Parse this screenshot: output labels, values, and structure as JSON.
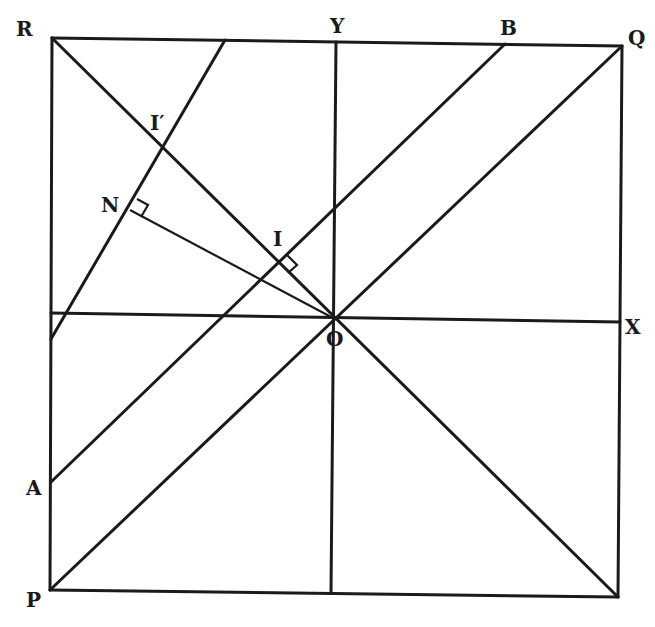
{
  "diagram": {
    "title": "",
    "points": {
      "R": {
        "label": "R",
        "x": 52,
        "y": 38
      },
      "Q": {
        "label": "Q",
        "x": 622,
        "y": 46
      },
      "P": {
        "label": "P",
        "x": 50,
        "y": 590
      },
      "S": {
        "label": "",
        "x": 618,
        "y": 597
      },
      "O": {
        "label": "O",
        "x": 333,
        "y": 318
      },
      "Y": {
        "label": "Y",
        "x": 336,
        "y": 42
      },
      "X": {
        "label": "X",
        "x": 620,
        "y": 322
      },
      "A": {
        "label": "A",
        "x": 51,
        "y": 482
      },
      "B": {
        "label": "B",
        "x": 505,
        "y": 44
      },
      "I": {
        "label": "I",
        "x": 280,
        "y": 262
      },
      "I_prime": {
        "label": "I′",
        "x": 162,
        "y": 150
      },
      "N": {
        "label": "N",
        "x": 130,
        "y": 210
      }
    },
    "labels": {
      "R": "R",
      "Y": "Y",
      "B": "B",
      "Q": "Q",
      "I_prime": "I′",
      "N": "N",
      "I": "I",
      "X": "X",
      "O": "O",
      "A": "A",
      "P": "P"
    },
    "segments": [
      {
        "name": "square-top",
        "from": "R",
        "to": "Q"
      },
      {
        "name": "square-left",
        "from": "R",
        "to": "P"
      },
      {
        "name": "square-bottom",
        "from": "P",
        "to": "S"
      },
      {
        "name": "square-right",
        "from": "Q",
        "to": "S"
      },
      {
        "name": "diagonal-RS",
        "from": "R",
        "to": "S"
      },
      {
        "name": "diagonal-PQ",
        "from": "P",
        "to": "Q"
      },
      {
        "name": "y-axis",
        "from": "Y",
        "to": "bottom"
      },
      {
        "name": "x-axis",
        "from": "left",
        "to": "X"
      },
      {
        "name": "line-AB",
        "from": "A",
        "to": "B"
      },
      {
        "name": "line-through-I-prime",
        "from": "top",
        "to": "left"
      },
      {
        "name": "perpendicular-ON",
        "from": "O",
        "to": "N"
      },
      {
        "name": "perpendicular-OI",
        "from": "O",
        "to": "I"
      }
    ],
    "right_angle_marks": [
      "N",
      "I"
    ]
  }
}
